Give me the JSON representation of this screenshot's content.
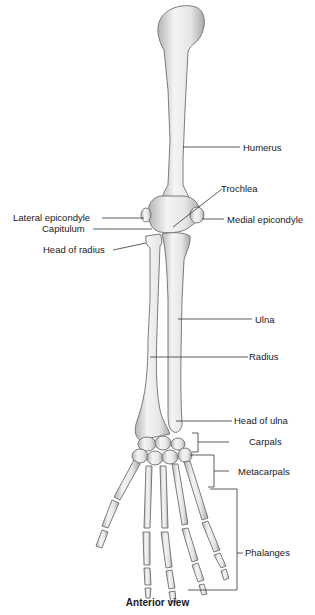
{
  "diagram": {
    "title": "Anterior view",
    "labels": {
      "humerus": "Humerus",
      "trochlea": "Trochlea",
      "lateral_epicondyle": "Lateral epicondyle",
      "medial_epicondyle": "Medial epicondyle",
      "capitulum": "Capitulum",
      "head_of_radius": "Head of radius",
      "ulna": "Ulna",
      "radius": "Radius",
      "head_of_ulna": "Head of ulna",
      "carpals": "Carpals",
      "metacarpals": "Metacarpals",
      "phalanges": "Phalanges"
    },
    "colors": {
      "bone_fill": "#ececec",
      "bone_shade": "#b8b8b8",
      "bone_outline": "#6e6e6e",
      "leader_line": "#333333",
      "text": "#1a1a1a"
    }
  }
}
